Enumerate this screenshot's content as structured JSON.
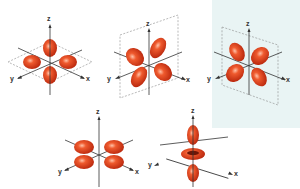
{
  "colors": {
    "lobe": "#e0401c",
    "lobe_dark": "#b8260c",
    "lobe_highlight": "#ffb79d",
    "axis": "#333333",
    "plane": "#7a7a7a",
    "panel_bg": "#e9f4f4"
  },
  "orbitals": [
    {
      "id": "dxy",
      "axes": {
        "x": "x",
        "y": "y",
        "z": "z"
      }
    },
    {
      "id": "dxz",
      "axes": {
        "x": "x",
        "y": "y",
        "z": "z"
      }
    },
    {
      "id": "dyz",
      "axes": {
        "x": "x",
        "y": "y",
        "z": "z"
      }
    },
    {
      "id": "dx2-y2",
      "axes": {
        "x": "x",
        "y": "y",
        "z": "z"
      }
    },
    {
      "id": "dz2",
      "axes": {
        "x": "x",
        "y": "y",
        "z": "z"
      }
    }
  ]
}
